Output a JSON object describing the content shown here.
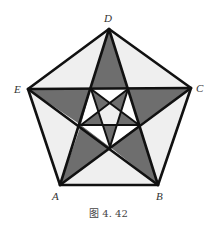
{
  "figure": {
    "caption": "图 4. 42",
    "colors": {
      "dark_fill": "#6e6e6e",
      "light_fill": "#efefef",
      "white_fill": "#ffffff",
      "stroke": "#111111"
    },
    "vertices": [
      {
        "label": "A",
        "x": 60,
        "y": 185
      },
      {
        "label": "B",
        "x": 158,
        "y": 185
      },
      {
        "label": "C",
        "x": 191,
        "y": 88
      },
      {
        "label": "D",
        "x": 109,
        "y": 29
      },
      {
        "label": "E",
        "x": 28,
        "y": 89
      }
    ]
  }
}
